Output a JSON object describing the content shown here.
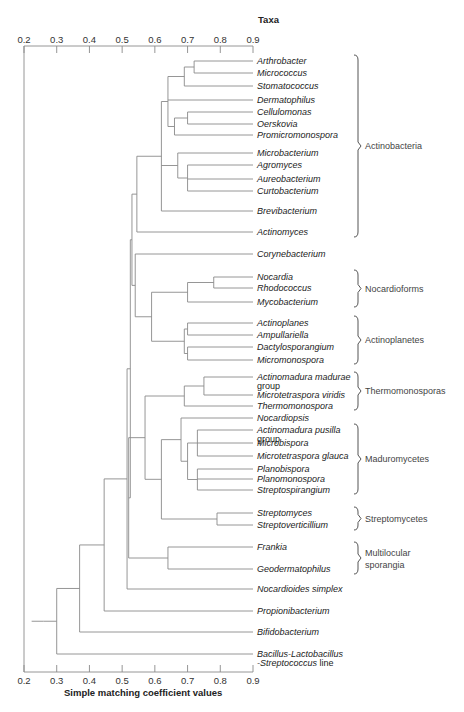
{
  "chart_data": {
    "type": "dendrogram",
    "title": "Taxa",
    "xlabel": "Simple matching coefficient values",
    "xlim": [
      0.2,
      0.9
    ],
    "ticks": [
      "0.2",
      "0.3",
      "0.4",
      "0.5",
      "0.6",
      "0.7",
      "0.8",
      "0.9"
    ],
    "leaves": [
      {
        "name": "Arthrobacter",
        "y": 61
      },
      {
        "name": "Micrococcus",
        "y": 73
      },
      {
        "name": "Stomatococcus",
        "y": 86
      },
      {
        "name": "Dermatophilus",
        "y": 100
      },
      {
        "name": "Cellulomonas",
        "y": 112
      },
      {
        "name": "Oerskovia",
        "y": 124
      },
      {
        "name": "Promicromonospora",
        "y": 135
      },
      {
        "name": "Microbacterium",
        "y": 153
      },
      {
        "name": "Agromyces",
        "y": 165
      },
      {
        "name": "Aureobacterium",
        "y": 179
      },
      {
        "name": "Curtobacterium",
        "y": 191
      },
      {
        "name": "Brevibacterium",
        "y": 211
      },
      {
        "name": "Actinomyces",
        "y": 232
      },
      {
        "name": "Corynebacterium",
        "y": 254
      },
      {
        "name": "Nocardia",
        "y": 277
      },
      {
        "name": "Rhodococcus",
        "y": 288
      },
      {
        "name": "Mycobacterium",
        "y": 302
      },
      {
        "name": "Actinoplanes",
        "y": 323
      },
      {
        "name": "Ampullariella",
        "y": 335
      },
      {
        "name": "Dactylosporangium",
        "y": 347
      },
      {
        "name": "Micromonospora",
        "y": 360
      },
      {
        "name": "Actinomadura madurae",
        "line2": "group",
        "y": 377
      },
      {
        "name": "Microtetraspora viridis",
        "y": 395
      },
      {
        "name": "Thermomonospora",
        "y": 406
      },
      {
        "name": "Nocardiopsis",
        "y": 418
      },
      {
        "name": "Actinomadura pusilla",
        "line2": "group",
        "y": 430
      },
      {
        "name": "Microbispora",
        "y": 443
      },
      {
        "name": "Microtetraspora glauca",
        "y": 456
      },
      {
        "name": "Planobispora",
        "y": 469
      },
      {
        "name": "Planomonospora",
        "y": 479
      },
      {
        "name": "Streptospirangium",
        "y": 490
      },
      {
        "name": "Streptomyces",
        "y": 513
      },
      {
        "name": "Streptoverticillium",
        "y": 525
      },
      {
        "name": "Frankia",
        "y": 547
      },
      {
        "name": "Geodermatophilus",
        "y": 569
      },
      {
        "name": "Nocardioides simplex",
        "y": 589
      },
      {
        "name": "Propionibacterium",
        "y": 611
      },
      {
        "name": "Bifidobacterium",
        "y": 632
      },
      {
        "name": "Bacillus-Lactobacillus",
        "line2_italic": "-Streptococcus",
        "line2_plain": " line",
        "y": 654
      }
    ],
    "groups": [
      {
        "label": "Actinobacteria",
        "y1": 55,
        "y2": 237
      },
      {
        "label": "Nocardioforms",
        "y1": 270,
        "y2": 307
      },
      {
        "label": "Actinoplanetes",
        "y1": 316,
        "y2": 364
      },
      {
        "label": "Thermomonosporas",
        "y1": 372,
        "y2": 410
      },
      {
        "label": "Maduromycetes",
        "y1": 424,
        "y2": 494
      },
      {
        "label": "Streptomycetes",
        "y1": 507,
        "y2": 530
      },
      {
        "label": "Multilocular",
        "label2": "sporangia",
        "y1": 542,
        "y2": 574
      }
    ],
    "merges_similarity_approx": [
      {
        "members": [
          "Arthrobacter",
          "Micrococcus"
        ],
        "value": 0.72
      },
      {
        "members": [
          "Arthrobacter+Micrococcus",
          "Stomatococcus"
        ],
        "value": 0.69
      },
      {
        "members": [
          "Cellulomonas",
          "Oerskovia"
        ],
        "value": 0.7
      },
      {
        "members": [
          "Cellulomonas+Oerskovia",
          "Promicromonospora"
        ],
        "value": 0.66
      },
      {
        "members": [
          "Arthrobacter..Stomatococcus",
          "Dermatophilus",
          "Cellulomonas..Promicromonospora"
        ],
        "value": 0.64
      },
      {
        "members": [
          "Agromyces",
          "Aureobacterium",
          "Curtobacterium"
        ],
        "value": 0.7
      },
      {
        "members": [
          "Microbacterium",
          "Agromyces..Curtobacterium"
        ],
        "value": 0.67
      },
      {
        "members": [
          "Arthrobacter..Promicromonospora",
          "Microbacterium..Curtobacterium",
          "Brevibacterium"
        ],
        "value": 0.62
      },
      {
        "members": [
          "Arthrobacter..Brevibacterium",
          "Actinomyces"
        ],
        "value": 0.545
      },
      {
        "members": [
          "Nocardia",
          "Rhodococcus"
        ],
        "value": 0.78
      },
      {
        "members": [
          "Nocardia+Rhodococcus",
          "Mycobacterium"
        ],
        "value": 0.7
      },
      {
        "members": [
          "Actinoplanes",
          "Ampullariella"
        ],
        "value": 0.7
      },
      {
        "members": [
          "Dactylosporangium",
          "Micromonospora"
        ],
        "value": 0.7
      },
      {
        "members": [
          "Actinoplanes..Ampullariella",
          "Dactylosporangium..Micromonospora"
        ],
        "value": 0.69
      },
      {
        "members": [
          "Nocardioforms",
          "Actinoplanetes"
        ],
        "value": 0.59
      },
      {
        "members": [
          "Corynebacterium",
          "Nocardioforms+Actinoplanetes"
        ],
        "value": 0.54
      },
      {
        "members": [
          "Actinomadura madurae group",
          "Microtetraspora viridis"
        ],
        "value": 0.75
      },
      {
        "members": [
          "A. madurae+M. viridis",
          "Thermomonospora"
        ],
        "value": 0.69
      },
      {
        "members": [
          "Actinomadura pusilla group",
          "Microbispora",
          "Microtetraspora glauca"
        ],
        "value": 0.73
      },
      {
        "members": [
          "Planobispora",
          "Planomonospora",
          "Streptospirangium"
        ],
        "value": 0.73
      },
      {
        "members": [
          "A. pusilla..M. glauca",
          "Planobispora..Streptospirangium"
        ],
        "value": 0.7
      },
      {
        "members": [
          "Nocardiopsis",
          "Maduromycetes core"
        ],
        "value": 0.68
      },
      {
        "members": [
          "Streptomyces",
          "Streptoverticillium"
        ],
        "value": 0.79
      },
      {
        "members": [
          "Nocardiopsis+Maduromycetes",
          "Streptomycetes"
        ],
        "value": 0.62
      },
      {
        "members": [
          "Thermomonosporas",
          "Maduromycetes+Streptomycetes"
        ],
        "value": 0.57
      },
      {
        "members": [
          "Frankia",
          "Geodermatophilus"
        ],
        "value": 0.64
      },
      {
        "members": [
          "Thermomonosporas..Streptomycetes",
          "Multilocular sporangia"
        ],
        "value": 0.52
      },
      {
        "members": [
          "Actinobacteria cluster",
          "Corynebacterium..Actinoplanetes"
        ],
        "value": 0.53
      },
      {
        "members": [
          "upper cluster",
          "lower cluster"
        ],
        "value": 0.525
      },
      {
        "members": [
          "all above",
          "Nocardioides simplex"
        ],
        "value": 0.515
      },
      {
        "members": [
          "all above",
          "Propionibacterium"
        ],
        "value": 0.445
      },
      {
        "members": [
          "all above",
          "Bifidobacterium"
        ],
        "value": 0.37
      },
      {
        "members": [
          "all above",
          "Bacillus-Lactobacillus-Streptococcus line"
        ],
        "value": 0.3
      },
      {
        "members": [
          "root"
        ],
        "value": 0.26
      }
    ]
  }
}
